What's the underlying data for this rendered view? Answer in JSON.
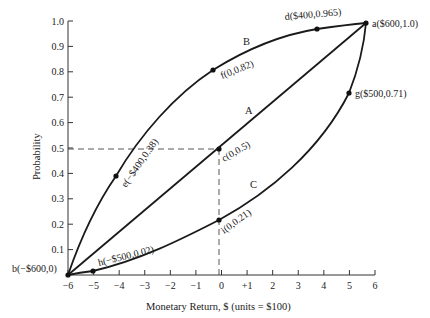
{
  "chart_data": {
    "type": "line",
    "title": "",
    "xlabel": "Monetary Return, $ (units = $100)",
    "ylabel": "Probability",
    "xlim": [
      -6,
      6
    ],
    "ylim": [
      0,
      1.0
    ],
    "x_ticks": [
      "-6",
      "-5",
      "-4",
      "-3",
      "-2",
      "-1",
      "0",
      "+1",
      "2",
      "3",
      "4",
      "5",
      "6"
    ],
    "y_ticks": [
      "1.0",
      "0.9",
      "0.8",
      "0.7",
      "0.6",
      "0.5",
      "0.4",
      "0.3",
      "0.2",
      "0.1"
    ],
    "grid": false,
    "legend": null,
    "series": [
      {
        "name": "B",
        "description": "concave (risk-averse) utility curve",
        "points": [
          {
            "label": "b",
            "x": -6,
            "y": 0
          },
          {
            "label": "e",
            "x": -4,
            "y": 0.38
          },
          {
            "label": "f",
            "x": 0,
            "y": 0.82
          },
          {
            "label": "d",
            "x": 4,
            "y": 0.965
          },
          {
            "label": "a",
            "x": 6,
            "y": 1.0
          }
        ]
      },
      {
        "name": "A",
        "description": "linear (risk-neutral) utility curve",
        "points": [
          {
            "label": "b",
            "x": -6,
            "y": 0
          },
          {
            "label": "c",
            "x": 0,
            "y": 0.5
          },
          {
            "label": "a",
            "x": 6,
            "y": 1.0
          }
        ]
      },
      {
        "name": "C",
        "description": "convex (risk-seeking) utility curve",
        "points": [
          {
            "label": "b",
            "x": -6,
            "y": 0
          },
          {
            "label": "h",
            "x": -5,
            "y": 0.02
          },
          {
            "label": "i",
            "x": 0,
            "y": 0.21
          },
          {
            "label": "g",
            "x": 5,
            "y": 0.71
          },
          {
            "label": "a",
            "x": 6,
            "y": 1.0
          }
        ]
      }
    ],
    "annotations": [
      {
        "text": "a($600,1.0)",
        "x": 6,
        "y": 1.0
      },
      {
        "text": "b(−$600,0)",
        "x": -6,
        "y": 0
      },
      {
        "text": "c(0,0.5)",
        "x": 0,
        "y": 0.5
      },
      {
        "text": "d($400,0.965)",
        "x": 4,
        "y": 0.965
      },
      {
        "text": "e(−$400,0.38)",
        "x": -4,
        "y": 0.38
      },
      {
        "text": "f(0,0.82)",
        "x": 0,
        "y": 0.82
      },
      {
        "text": "g($500,0.71)",
        "x": 5,
        "y": 0.71
      },
      {
        "text": "h(−$500,0.02)",
        "x": -5,
        "y": 0.02
      },
      {
        "text": "i(0,0.21)",
        "x": 0,
        "y": 0.21
      }
    ],
    "reference_lines": [
      {
        "type": "dashed-horizontal",
        "y": 0.5,
        "from_x": -6,
        "to_x": 0
      },
      {
        "type": "dashed-vertical",
        "x": 0,
        "from_y": 0,
        "to_y": 0.5
      }
    ]
  },
  "labels": {
    "xlabel": "Monetary Return, $ (units = $100)",
    "ylabel": "Probability",
    "curve_a": "A",
    "curve_b": "B",
    "curve_c": "C",
    "pt_a": "a($600,1.0)",
    "pt_b": "b(−$600,0)",
    "pt_c": "c(0,0.5)",
    "pt_d": "d($400,0.965)",
    "pt_e": "e(−$400,0.38)",
    "pt_f": "f(0,0.82)",
    "pt_g": "g($500,0.71)",
    "pt_h": "h(−$500,0.02)",
    "pt_i": "i(0,0.21)"
  }
}
